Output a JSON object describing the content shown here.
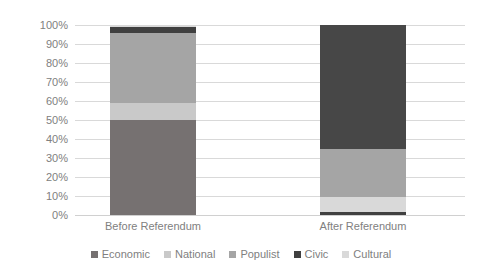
{
  "chart_data": {
    "type": "bar",
    "subtype": "100% stacked column",
    "title": "",
    "subtitle": "",
    "xlabel": "",
    "ylabel": "",
    "categories": [
      "Before Referendum",
      "After Referendum"
    ],
    "ylim": [
      0,
      100
    ],
    "y_tick_labels": [
      "100%",
      "90%",
      "80%",
      "70%",
      "60%",
      "50%",
      "40%",
      "30%",
      "20%",
      "10%",
      "0%"
    ],
    "y_tick_values": [
      100,
      90,
      80,
      70,
      60,
      50,
      40,
      30,
      20,
      10,
      0
    ],
    "grid": true,
    "grid_axis": "y",
    "legend_position": "bottom",
    "stack_order_bottom_to_top": [
      "Economic",
      "National",
      "Populist",
      "Civic",
      "Cultural"
    ],
    "series": [
      {
        "name": "Economic",
        "color": "#767171",
        "values": [
          50,
          0
        ]
      },
      {
        "name": "National",
        "color": "#C9C9C9",
        "values": [
          9,
          0
        ]
      },
      {
        "name": "Populist",
        "color": "#A5A5A5",
        "values": [
          37,
          0
        ]
      },
      {
        "name": "Civic",
        "color": "#404040",
        "values": [
          3,
          0
        ]
      },
      {
        "name": "Cultural",
        "color": "#D9D9D9",
        "values": [
          1,
          0
        ]
      }
    ],
    "series_after": [
      {
        "name": "Civic",
        "color": "#404040",
        "value": 1.5
      },
      {
        "name": "Cultural",
        "color": "#D9D9D9",
        "value": 8
      },
      {
        "name": "Populist",
        "color": "#A5A5A5",
        "value": 25.5
      },
      {
        "name": "Economic",
        "color": "#474747",
        "value": 65
      }
    ]
  },
  "axis": {
    "y_ticks": [
      {
        "label": "100%",
        "value": 100
      },
      {
        "label": "90%",
        "value": 90
      },
      {
        "label": "80%",
        "value": 80
      },
      {
        "label": "70%",
        "value": 70
      },
      {
        "label": "60%",
        "value": 60
      },
      {
        "label": "50%",
        "value": 50
      },
      {
        "label": "40%",
        "value": 40
      },
      {
        "label": "30%",
        "value": 30
      },
      {
        "label": "20%",
        "value": 20
      },
      {
        "label": "10%",
        "value": 10
      },
      {
        "label": "0%",
        "value": 0
      }
    ]
  },
  "categories": [
    {
      "label": "Before Referendum"
    },
    {
      "label": "After Referendum"
    }
  ],
  "bars": {
    "before": [
      {
        "name": "Economic",
        "color": "#767171",
        "start": 0,
        "size": 50
      },
      {
        "name": "National",
        "color": "#C9C9C9",
        "start": 50,
        "size": 9
      },
      {
        "name": "Populist",
        "color": "#A5A5A5",
        "start": 59,
        "size": 37
      },
      {
        "name": "Civic",
        "color": "#404040",
        "start": 96,
        "size": 3
      },
      {
        "name": "Cultural",
        "color": "#D9D9D9",
        "start": 99,
        "size": 1
      }
    ],
    "after": [
      {
        "name": "Civic",
        "color": "#404040",
        "start": 0,
        "size": 1.5
      },
      {
        "name": "Cultural",
        "color": "#D9D9D9",
        "start": 1.5,
        "size": 8
      },
      {
        "name": "Populist",
        "color": "#A5A5A5",
        "start": 9.5,
        "size": 25.5
      },
      {
        "name": "Economic",
        "color": "#474747",
        "start": 35,
        "size": 65
      }
    ]
  },
  "legend": {
    "items": [
      {
        "label": "Economic",
        "color": "#767171"
      },
      {
        "label": "National",
        "color": "#C9C9C9"
      },
      {
        "label": "Populist",
        "color": "#A5A5A5"
      },
      {
        "label": "Civic",
        "color": "#404040"
      },
      {
        "label": "Cultural",
        "color": "#D9D9D9"
      }
    ]
  },
  "colors": {
    "background": "#FFFFFF",
    "gridline": "#D9D9D9",
    "tick_text": "#808080"
  }
}
